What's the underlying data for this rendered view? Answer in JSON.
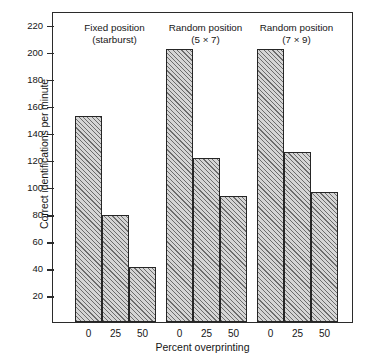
{
  "chart_data": {
    "type": "bar",
    "title": "",
    "xlabel": "Percent overprinting",
    "ylabel": "Correct identifications per minute",
    "ylim": [
      0,
      230
    ],
    "yticks": [
      20,
      40,
      60,
      80,
      100,
      120,
      140,
      160,
      180,
      200,
      220
    ],
    "grid": false,
    "legend": "none",
    "categories": [
      "0",
      "25",
      "50"
    ],
    "groups": [
      {
        "name": "Fixed position (starburst)",
        "label_line1": "Fixed position",
        "label_line2": "(starburst)",
        "values": [
          152,
          79,
          41
        ]
      },
      {
        "name": "Random position (5 × 7)",
        "label_line1": "Random position",
        "label_line2": "(5 × 7)",
        "values": [
          202,
          121,
          93
        ]
      },
      {
        "name": "Random position (7 × 9)",
        "label_line1": "Random position",
        "label_line2": "(7 × 9)",
        "values": [
          202,
          126,
          96
        ]
      }
    ],
    "bar_fill_color": "#d5d5d5",
    "bar_edge_color": "#262626",
    "axis_color": "#2b2b2b",
    "background_color": "#ffffff"
  }
}
